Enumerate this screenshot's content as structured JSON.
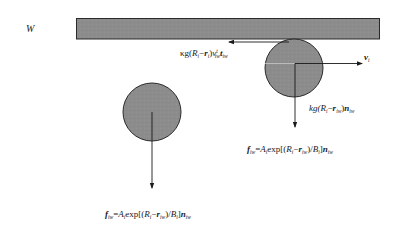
{
  "diagram": {
    "type": "force-diagram",
    "colors": {
      "wall_fill": "#8c8c8c",
      "particle_fill": "#8e8e8e",
      "outline": "#2a2a2a",
      "arrow": "#1a1a1a",
      "background": "#ffffff"
    },
    "wall": {
      "label": "W"
    },
    "particles": [
      {
        "id": "particle-touching-wall",
        "forces": [
          {
            "id": "tangential-friction",
            "label_text": "κg(Ri−ri)vtiw tiw",
            "direction": "left"
          },
          {
            "id": "velocity",
            "label_text": "vi",
            "direction": "right"
          },
          {
            "id": "body-compression",
            "label_text": "kg(Ri−riw)niw",
            "direction": "down"
          },
          {
            "id": "repulsive-near",
            "label_text": "fiw=Aiexp[(Ri−riw)/Bi]niw",
            "direction": "down"
          }
        ]
      },
      {
        "id": "particle-away-from-wall",
        "forces": [
          {
            "id": "repulsive-far",
            "label_text": "fiw=Aiexp[(Ri−riw)/Bi]niw",
            "direction": "down"
          }
        ]
      }
    ],
    "labels": {
      "wall": "W",
      "kappa_g": "κg(",
      "R": "R",
      "i": "i",
      "minus": "−",
      "r": "r",
      "close_paren": ")",
      "v": "v",
      "t_sup": "t",
      "iw": "iw",
      "t_bold": "t",
      "kg": "kg(",
      "n": "n",
      "f": "f",
      "equals": "=",
      "A": "A",
      "exp_open": "exp[(",
      "slash_B": ")/",
      "B": "B",
      "close_bracket": "]"
    }
  }
}
